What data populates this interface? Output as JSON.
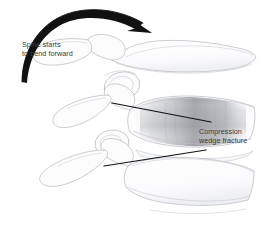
{
  "figure": {
    "background_color": "#ffffff",
    "width": 260,
    "height": 236
  },
  "annotations": {
    "bend_arrow": {
      "icon": "curved-arrow-icon",
      "description": "curved arrow sweeping left to right over the top of the spine",
      "color": "#111111"
    },
    "spine_label": {
      "line1": "Spine starts",
      "line2": "to bend forward",
      "color": "#3b3b3b"
    },
    "fracture_label": {
      "line1": "Compression",
      "line2": "wedge fracture",
      "color": "#3b3b3b"
    },
    "leader_lines": {
      "upper": {
        "icon": "leader-line-icon",
        "color": "#121212"
      },
      "lower": {
        "icon": "leader-line-icon",
        "color": "#121212"
      }
    }
  },
  "anatomy": {
    "line_color": "#b9bcc4",
    "fill_color": "#fcfcfd",
    "shade_color": "#8e9096",
    "structures": [
      {
        "name": "vertebra-upper",
        "label": "Upper vertebra"
      },
      {
        "name": "vertebra-fractured",
        "label": "Fractured wedge vertebra"
      },
      {
        "name": "vertebra-lower",
        "label": "Lower vertebra"
      },
      {
        "name": "spinous-process-upper",
        "label": "Upper spinous process"
      },
      {
        "name": "spinous-process-middle",
        "label": "Middle spinous process"
      },
      {
        "name": "spinous-process-lower",
        "label": "Lower spinous process"
      },
      {
        "name": "facet-joint-upper",
        "label": "Upper facet joint"
      },
      {
        "name": "facet-joint-lower",
        "label": "Lower facet joint"
      },
      {
        "name": "intervertebral-disc",
        "label": "Intervertebral disc"
      }
    ]
  }
}
